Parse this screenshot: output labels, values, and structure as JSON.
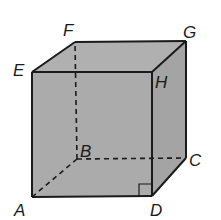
{
  "diagram": {
    "vertices": {
      "A": {
        "label": "A"
      },
      "B": {
        "label": "B"
      },
      "C": {
        "label": "C"
      },
      "D": {
        "label": "D"
      },
      "E": {
        "label": "E"
      },
      "F": {
        "label": "F"
      },
      "G": {
        "label": "G"
      },
      "H": {
        "label": "H"
      }
    },
    "hidden_edges": [
      "AB",
      "BC",
      "BF"
    ],
    "visible_edges": [
      "AD",
      "DC",
      "CG",
      "GF",
      "FE",
      "EA",
      "EH",
      "HG",
      "HD"
    ],
    "right_angle_at": "D",
    "colors": {
      "fill": "#a8a8a8",
      "edge": "#1a1a1a",
      "background": "#ffffff"
    }
  }
}
